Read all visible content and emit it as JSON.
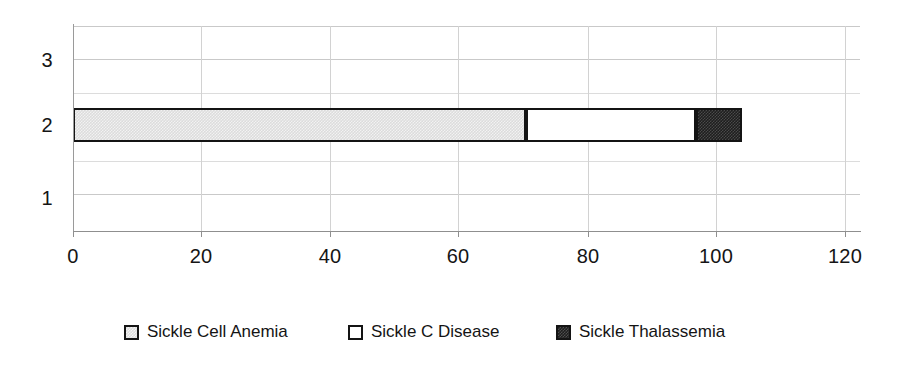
{
  "chart_data": {
    "type": "bar",
    "orientation": "horizontal",
    "stacked": true,
    "title": "",
    "subtitle": "",
    "xlabel": "",
    "ylabel": "",
    "categories": [
      "1",
      "2",
      "3"
    ],
    "x": [
      0,
      20,
      40,
      60,
      80,
      100,
      120
    ],
    "xlim": [
      0,
      120
    ],
    "xticks": [
      "0",
      "20",
      "40",
      "60",
      "80",
      "100",
      "120"
    ],
    "yticks": [
      "1",
      "2",
      "3"
    ],
    "grid": true,
    "grid_axis": "both",
    "legend_position": "bottom",
    "series": [
      {
        "name": "Sickle Cell Anemia",
        "color": "#dcdcdc",
        "values": [
          0,
          69,
          0
        ]
      },
      {
        "name": "Sickle C Disease",
        "color": "#ffffff",
        "values": [
          0,
          26,
          0
        ]
      },
      {
        "name": "Sickle Thalassemia",
        "color": "#1e1e1e",
        "values": [
          0,
          7,
          0
        ]
      }
    ],
    "stack_breakpoints": [
      0,
      69,
      95,
      102
    ],
    "bar_total": 102,
    "annotations": []
  },
  "axes": {
    "x_tick_labels": [
      {
        "value": 0,
        "label": "0"
      },
      {
        "value": 20,
        "label": "20"
      },
      {
        "value": 40,
        "label": "40"
      },
      {
        "value": 60,
        "label": "60"
      },
      {
        "value": 80,
        "label": "80"
      },
      {
        "value": 100,
        "label": "100"
      },
      {
        "value": 120,
        "label": "120"
      }
    ],
    "y_tick_labels": [
      {
        "value": 3,
        "label": "3"
      },
      {
        "value": 2,
        "label": "2"
      },
      {
        "value": 1,
        "label": "1"
      }
    ]
  },
  "legend": {
    "items": [
      {
        "label": "Sickle Cell Anemia",
        "swatch": "light-gray-pattern-swatch"
      },
      {
        "label": "Sickle C Disease",
        "swatch": "white-swatch"
      },
      {
        "label": "Sickle Thalassemia",
        "swatch": "dark-pattern-swatch"
      }
    ]
  }
}
